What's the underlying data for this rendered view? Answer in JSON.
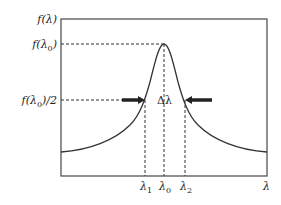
{
  "diagram": {
    "axis_labels": {
      "y_axis": "f(λ)",
      "x_axis": "λ"
    },
    "y_ticks": [
      {
        "label": "f(λ0)",
        "base": "f(λ",
        "sub": "0",
        "tail": ")"
      },
      {
        "label": "f(λ0)/2",
        "base": "f(λ",
        "sub": "0",
        "tail": ")/2"
      }
    ],
    "x_ticks": [
      {
        "label": "λ1",
        "base": "λ",
        "sub": "1"
      },
      {
        "label": "λ0",
        "base": "λ",
        "sub": "0"
      },
      {
        "label": "λ2",
        "base": "λ",
        "sub": "2"
      }
    ],
    "annotation": "Δλ",
    "colors": {
      "line": "#333333",
      "background": "#ffffff"
    }
  }
}
